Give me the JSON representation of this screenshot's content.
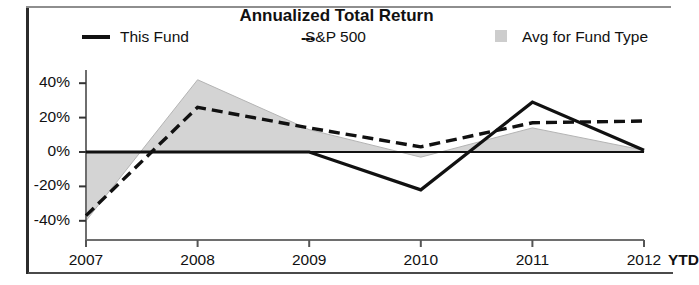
{
  "chart_data": {
    "type": "line",
    "title": "Annualized Total Return",
    "xlabel": "",
    "ylabel": "",
    "x": [
      "2007",
      "2008",
      "2009",
      "2010",
      "2011",
      "2012 YTD"
    ],
    "categories": [
      "2007",
      "2008",
      "2009",
      "2010",
      "2011",
      "2012 YTD"
    ],
    "ylim": [
      -48,
      46
    ],
    "yticks": [
      40,
      20,
      0,
      -20,
      -40
    ],
    "ytick_labels": [
      "40%",
      "20%",
      "0%",
      "-20%",
      "-40%"
    ],
    "grid": false,
    "legend_position": "top",
    "series": [
      {
        "name": "This Fund",
        "style": "solid",
        "color": "#111111",
        "values": [
          0,
          0,
          0,
          -22,
          29,
          1
        ]
      },
      {
        "name": "S&P 500",
        "style": "dashed",
        "color": "#111111",
        "values": [
          -37,
          26,
          14,
          3,
          17,
          18
        ]
      },
      {
        "name": "Avg for Fund Type",
        "style": "filled-band",
        "color": "#cdcdcd",
        "values": [
          -40,
          42,
          13,
          -3,
          14,
          1
        ]
      }
    ],
    "legend": [
      {
        "label": "This Fund",
        "marker": "solid-line"
      },
      {
        "label": "S&P 500",
        "marker": "dashed-line",
        "prefix": "---"
      },
      {
        "label": "Avg for Fund Type",
        "marker": "gray-square"
      }
    ]
  }
}
